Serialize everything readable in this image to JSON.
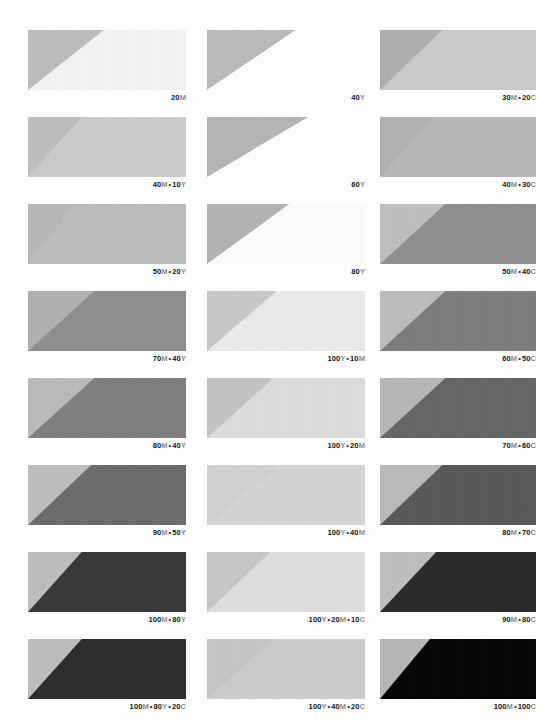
{
  "page": {
    "background": "#fefefe",
    "columns": 3,
    "rows": 8,
    "label_color": "#131313",
    "ink_letter_color": "#8a8a8a"
  },
  "swatches": [
    {
      "id": "r1c1",
      "label": "20M",
      "parts": [
        {
          "num": "20",
          "ink": "M"
        }
      ],
      "triangle_color": "#bbbbbb",
      "body_color": "#f2f2f2",
      "apex_pct": 48
    },
    {
      "id": "r1c2",
      "label": "40Y",
      "parts": [
        {
          "num": "40",
          "ink": "Y"
        }
      ],
      "triangle_color": "#b9b9b9",
      "body_color": "#fdfdfd",
      "apex_pct": 56
    },
    {
      "id": "r1c3",
      "label": "30M • 20C",
      "parts": [
        {
          "num": "30",
          "ink": "M"
        },
        {
          "num": "20",
          "ink": "C"
        }
      ],
      "triangle_color": "#aeaeae",
      "body_color": "#c9c9c9",
      "apex_pct": 40
    },
    {
      "id": "r2c1",
      "label": "40M • 10Y",
      "parts": [
        {
          "num": "40",
          "ink": "M"
        },
        {
          "num": "10",
          "ink": "Y"
        }
      ],
      "triangle_color": "#bcbcbc",
      "body_color": "#cacaca",
      "apex_pct": 34
    },
    {
      "id": "r2c2",
      "label": "60Y",
      "parts": [
        {
          "num": "60",
          "ink": "Y"
        }
      ],
      "triangle_color": "#b4b4b4",
      "body_color": "#fdfdfd",
      "apex_pct": 64
    },
    {
      "id": "r2c3",
      "label": "40M • 30C",
      "parts": [
        {
          "num": "40",
          "ink": "M"
        },
        {
          "num": "30",
          "ink": "C"
        }
      ],
      "triangle_color": "#b1b1b1",
      "body_color": "#b8b8b8",
      "apex_pct": 34
    },
    {
      "id": "r3c1",
      "label": "50M • 20Y",
      "parts": [
        {
          "num": "50",
          "ink": "M"
        },
        {
          "num": "20",
          "ink": "Y"
        }
      ],
      "triangle_color": "#b7b7b7",
      "body_color": "#bcbcbc",
      "apex_pct": 30
    },
    {
      "id": "r3c2",
      "label": "80Y",
      "parts": [
        {
          "num": "80",
          "ink": "Y"
        }
      ],
      "triangle_color": "#b2b2b2",
      "body_color": "#fbfbfb",
      "apex_pct": 52
    },
    {
      "id": "r3c3",
      "label": "50M • 40C",
      "parts": [
        {
          "num": "50",
          "ink": "M"
        },
        {
          "num": "40",
          "ink": "C"
        }
      ],
      "triangle_color": "#bdbdbd",
      "body_color": "#8f8f8f",
      "apex_pct": 42
    },
    {
      "id": "r4c1",
      "label": "70M • 40Y",
      "parts": [
        {
          "num": "70",
          "ink": "M"
        },
        {
          "num": "40",
          "ink": "Y"
        }
      ],
      "triangle_color": "#b0b0b0",
      "body_color": "#8e8e8e",
      "apex_pct": 42
    },
    {
      "id": "r4c2",
      "label": "100Y • 10M",
      "parts": [
        {
          "num": "100",
          "ink": "Y"
        },
        {
          "num": "10",
          "ink": "M"
        }
      ],
      "triangle_color": "#c7c7c7",
      "body_color": "#e9e9e9",
      "apex_pct": 44
    },
    {
      "id": "r4c3",
      "label": "60M • 50C",
      "parts": [
        {
          "num": "60",
          "ink": "M"
        },
        {
          "num": "50",
          "ink": "C"
        }
      ],
      "triangle_color": "#bcbcbc",
      "body_color": "#7c7c7c",
      "apex_pct": 42
    },
    {
      "id": "r5c1",
      "label": "80M • 40Y",
      "parts": [
        {
          "num": "80",
          "ink": "M"
        },
        {
          "num": "40",
          "ink": "Y"
        }
      ],
      "triangle_color": "#bababa",
      "body_color": "#7f7f7f",
      "apex_pct": 42
    },
    {
      "id": "r5c2",
      "label": "100Y • 20M",
      "parts": [
        {
          "num": "100",
          "ink": "Y"
        },
        {
          "num": "20",
          "ink": "M"
        }
      ],
      "triangle_color": "#c2c2c2",
      "body_color": "#dcdcdc",
      "apex_pct": 42
    },
    {
      "id": "r5c3",
      "label": "70M • 60C",
      "parts": [
        {
          "num": "70",
          "ink": "M"
        },
        {
          "num": "60",
          "ink": "C"
        }
      ],
      "triangle_color": "#b6b6b6",
      "body_color": "#656565",
      "apex_pct": 42
    },
    {
      "id": "r6c1",
      "label": "90M • 50Y",
      "parts": [
        {
          "num": "90",
          "ink": "M"
        },
        {
          "num": "50",
          "ink": "Y"
        }
      ],
      "triangle_color": "#bdbdbd",
      "body_color": "#6b6b6b",
      "apex_pct": 40
    },
    {
      "id": "r6c2",
      "label": "100Y • 40M",
      "parts": [
        {
          "num": "100",
          "ink": "Y"
        },
        {
          "num": "40",
          "ink": "M"
        }
      ],
      "triangle_color": "#cfcfcf",
      "body_color": "#d4d4d4",
      "apex_pct": 46
    },
    {
      "id": "r6c3",
      "label": "80M • 70C",
      "parts": [
        {
          "num": "80",
          "ink": "M"
        },
        {
          "num": "70",
          "ink": "C"
        }
      ],
      "triangle_color": "#b9b9b9",
      "body_color": "#595959",
      "apex_pct": 40
    },
    {
      "id": "r7c1",
      "label": "100M • 80Y",
      "parts": [
        {
          "num": "100",
          "ink": "M"
        },
        {
          "num": "80",
          "ink": "Y"
        }
      ],
      "triangle_color": "#bcbcbc",
      "body_color": "#383838",
      "apex_pct": 34
    },
    {
      "id": "r7c2",
      "label": "100Y • 20M • 10C",
      "parts": [
        {
          "num": "100",
          "ink": "Y"
        },
        {
          "num": "20",
          "ink": "M"
        },
        {
          "num": "10",
          "ink": "C"
        }
      ],
      "triangle_color": "#c6c6c6",
      "body_color": "#dddddd",
      "apex_pct": 40
    },
    {
      "id": "r7c3",
      "label": "90M • 80C",
      "parts": [
        {
          "num": "90",
          "ink": "M"
        },
        {
          "num": "80",
          "ink": "C"
        }
      ],
      "triangle_color": "#bdbdbd",
      "body_color": "#2a2a2a",
      "apex_pct": 36
    },
    {
      "id": "r8c1",
      "label": "100M • 80Y • 20C",
      "parts": [
        {
          "num": "100",
          "ink": "M"
        },
        {
          "num": "80",
          "ink": "Y"
        },
        {
          "num": "20",
          "ink": "C"
        }
      ],
      "triangle_color": "#bcbcbc",
      "body_color": "#2c2c2c",
      "apex_pct": 34
    },
    {
      "id": "r8c2",
      "label": "100Y • 40M • 20C",
      "parts": [
        {
          "num": "100",
          "ink": "Y"
        },
        {
          "num": "40",
          "ink": "M"
        },
        {
          "num": "20",
          "ink": "C"
        }
      ],
      "triangle_color": "#c4c4c4",
      "body_color": "#cbcbcb",
      "apex_pct": 42
    },
    {
      "id": "r8c3",
      "label": "100M • 100C",
      "parts": [
        {
          "num": "100",
          "ink": "M"
        },
        {
          "num": "100",
          "ink": "C"
        }
      ],
      "triangle_color": "#b5b5b5",
      "body_color": "#050505",
      "apex_pct": 32
    }
  ],
  "layout": {
    "col_x": [
      28,
      207,
      380
    ],
    "col_w": [
      158,
      158,
      156
    ],
    "row_y": [
      30,
      117,
      204,
      291,
      378,
      465,
      552,
      639
    ],
    "swatch_h": 60
  }
}
